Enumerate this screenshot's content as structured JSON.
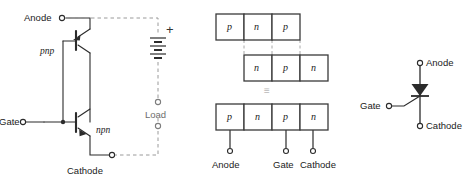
{
  "figure": {
    "colors": {
      "line": "#2b2b2b",
      "dash": "#9a9a9a",
      "block_fill": "#ffffff",
      "block_stroke": "#3a3a3a",
      "text": "#222222",
      "faint": "#b8b8b8",
      "background": "#ffffff"
    }
  },
  "panel_two_transistor": {
    "name": "two-transistor-equivalent",
    "terminals": {
      "anode": "Anode",
      "gate": "Gate",
      "cathode": "Cathode",
      "load": "Load"
    },
    "devices": {
      "upper_transistor": "pnp",
      "lower_transistor": "npn"
    },
    "source": {
      "polarity": "+",
      "type": "battery"
    }
  },
  "panel_layers": {
    "name": "pnpn-layer-structure",
    "top_row": [
      "p",
      "n",
      "p"
    ],
    "middle_row": [
      "n",
      "p",
      "n"
    ],
    "equivalence_symbol": "≡",
    "bottom_row": [
      "p",
      "n",
      "p",
      "n"
    ],
    "bottom_terminals": [
      "Anode",
      "Gate",
      "Cathode"
    ]
  },
  "panel_symbol": {
    "name": "scr-schematic-symbol",
    "terminals": {
      "anode": "Anode",
      "gate": "Gate",
      "cathode": "Cathode"
    }
  }
}
